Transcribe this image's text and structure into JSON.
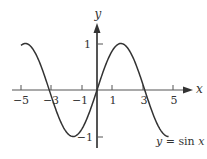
{
  "chart_data": {
    "type": "line",
    "title": "",
    "function": "y = sin x",
    "xlabel": "x",
    "ylabel": "y",
    "xlim": [
      -5.2,
      5.5
    ],
    "ylim": [
      -1.2,
      1.5
    ],
    "grid": false,
    "x_ticks": [
      -5,
      -3,
      -1,
      1,
      3,
      5
    ],
    "x_tick_labels": [
      "−5",
      "−3",
      "−1",
      "1",
      "3",
      "5"
    ],
    "y_ticks": [
      1,
      -1
    ],
    "y_tick_labels": [
      "1",
      "−1"
    ],
    "series": [
      {
        "name": "y = sin x",
        "x": [
          -5,
          -4.71,
          -4,
          -3.14,
          -2,
          -1.57,
          -1,
          0,
          1,
          1.57,
          2,
          3.14,
          4,
          4.71
        ],
        "values": [
          0.96,
          1,
          0.76,
          0,
          -0.91,
          -1,
          -0.84,
          0,
          0.84,
          1,
          0.91,
          0,
          -0.76,
          -1
        ]
      }
    ],
    "annotations": [
      {
        "text": "y = sin x",
        "position": "bottom-right"
      }
    ],
    "colors": {
      "curve": "#333333",
      "axis": "#555555"
    }
  },
  "labels": {
    "x_axis": "x",
    "y_axis": "y",
    "caption_y": "y",
    "caption_eq": " = sin ",
    "caption_x": "x",
    "xt0": "−5",
    "xt1": "−3",
    "xt2": "−1",
    "xt3": "1",
    "xt4": "3",
    "xt5": "5",
    "yt_pos": "1",
    "yt_neg": "−1"
  }
}
